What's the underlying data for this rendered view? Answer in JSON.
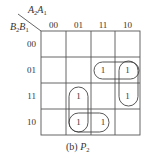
{
  "diagram": {
    "type": "karnaugh-map",
    "column_variable_label": {
      "main": "A",
      "sub1": "2",
      "main2": "A",
      "sub2": "1"
    },
    "row_variable_label": {
      "main": "B",
      "sub1": "2",
      "main2": "B",
      "sub2": "1"
    },
    "column_headers": [
      "00",
      "01",
      "11",
      "10"
    ],
    "row_headers": [
      "00",
      "01",
      "11",
      "10"
    ],
    "cells": [
      [
        "",
        "",
        "",
        ""
      ],
      [
        "",
        "",
        "1",
        "1"
      ],
      [
        "",
        "1",
        "",
        "1"
      ],
      [
        "",
        "1",
        "1",
        ""
      ]
    ],
    "groupings": [
      {
        "name": "row01-cols-11-10",
        "cells": [
          [
            1,
            2
          ],
          [
            1,
            3
          ]
        ]
      },
      {
        "name": "col10-rows-01-11",
        "cells": [
          [
            1,
            3
          ],
          [
            2,
            3
          ]
        ]
      },
      {
        "name": "col01-rows-11-10",
        "cells": [
          [
            2,
            1
          ],
          [
            3,
            1
          ]
        ]
      },
      {
        "name": "row10-cols-01-11",
        "cells": [
          [
            3,
            1
          ],
          [
            3,
            2
          ]
        ]
      }
    ],
    "caption": {
      "prefix": "(b) ",
      "var": "P",
      "sub": "2"
    },
    "colors": {
      "line": "#555555",
      "text": "#333333",
      "background": "#ffffff"
    }
  }
}
